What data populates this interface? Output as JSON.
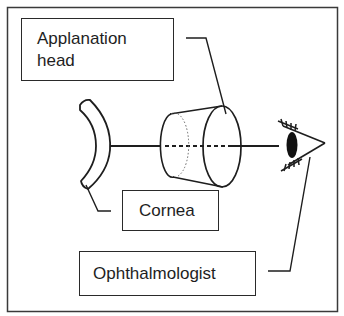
{
  "labels": {
    "applanation_head": {
      "line1": "Applanation",
      "line2": "head"
    },
    "cornea": "Cornea",
    "ophthalmologist": "Ophthalmologist"
  },
  "colors": {
    "stroke": "#1e1e1e",
    "background": "#ffffff",
    "frame": "#3a3a3a"
  },
  "icons": {
    "cornea": "cornea-crescent-shape",
    "applanation_head": "truncated-cone-shape",
    "eye": "observer-eye-icon"
  }
}
